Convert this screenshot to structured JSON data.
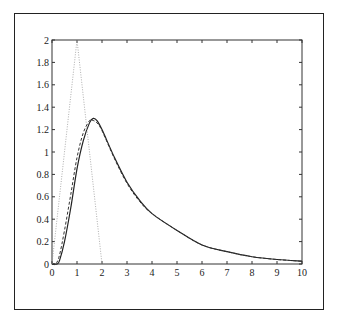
{
  "chart_data": {
    "type": "line",
    "title": "",
    "xlabel": "",
    "ylabel": "",
    "xlim": [
      0,
      10
    ],
    "ylim": [
      0,
      2
    ],
    "grid": false,
    "legend": null,
    "x_ticks": [
      "0",
      "1",
      "2",
      "3",
      "4",
      "5",
      "6",
      "7",
      "8",
      "9",
      "10"
    ],
    "y_ticks": [
      "0",
      "0.2",
      "0.4",
      "0.6",
      "0.8",
      "1",
      "1.2",
      "1.4",
      "1.6",
      "1.8",
      "2"
    ],
    "series": [
      {
        "name": "solid",
        "style": "solid",
        "x": [
          0,
          0.2,
          0.3,
          0.5,
          0.75,
          1.0,
          1.25,
          1.5,
          1.65,
          1.8,
          2.0,
          2.5,
          3.0,
          3.5,
          4.0,
          5.0,
          6.0,
          7.0,
          8.0,
          9.0,
          10.0
        ],
        "y": [
          0,
          0.0,
          0.03,
          0.2,
          0.5,
          0.85,
          1.1,
          1.26,
          1.3,
          1.28,
          1.2,
          0.95,
          0.73,
          0.57,
          0.45,
          0.3,
          0.17,
          0.11,
          0.065,
          0.04,
          0.025
        ]
      },
      {
        "name": "dashed",
        "style": "dashed",
        "x": [
          0,
          0.15,
          0.3,
          0.5,
          0.75,
          1.0,
          1.25,
          1.5,
          1.6,
          1.8,
          2.0,
          2.5,
          3.0,
          3.5,
          4.0,
          5.0,
          6.0,
          7.0,
          8.0,
          9.0,
          10.0
        ],
        "y": [
          0,
          0.0,
          0.08,
          0.3,
          0.62,
          0.95,
          1.17,
          1.28,
          1.285,
          1.26,
          1.19,
          0.94,
          0.72,
          0.56,
          0.45,
          0.3,
          0.17,
          0.11,
          0.065,
          0.04,
          0.025
        ]
      },
      {
        "name": "dotted triangle",
        "style": "dotted",
        "x": [
          0,
          1,
          2
        ],
        "y": [
          0,
          2,
          0
        ]
      }
    ]
  }
}
